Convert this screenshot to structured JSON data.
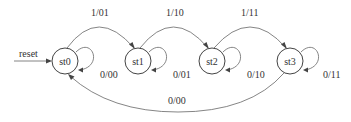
{
  "diagram": {
    "type": "state-machine",
    "reset": {
      "label": "reset"
    },
    "states": [
      {
        "id": "st0",
        "label": "st0"
      },
      {
        "id": "st1",
        "label": "st1"
      },
      {
        "id": "st2",
        "label": "st2"
      },
      {
        "id": "st3",
        "label": "st3"
      }
    ],
    "transitions": [
      {
        "from": "st0",
        "to": "st1",
        "label": "1/01"
      },
      {
        "from": "st1",
        "to": "st2",
        "label": "1/10"
      },
      {
        "from": "st2",
        "to": "st3",
        "label": "1/11"
      },
      {
        "from": "st3",
        "to": "st0",
        "label": "0/00"
      },
      {
        "from": "st0",
        "to": "st0",
        "label": "0/00"
      },
      {
        "from": "st1",
        "to": "st1",
        "label": "0/01"
      },
      {
        "from": "st2",
        "to": "st2",
        "label": "0/10"
      },
      {
        "from": "st3",
        "to": "st3",
        "label": "0/11"
      }
    ]
  }
}
